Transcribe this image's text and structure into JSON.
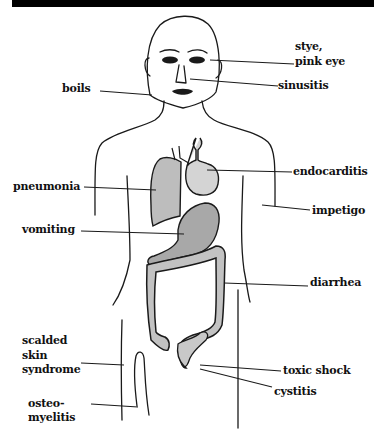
{
  "diagram": {
    "labels": {
      "stye": "stye,",
      "pink_eye": "pink eye",
      "sinusitis": "sinusitis",
      "boils": "boils",
      "pneumonia": "pneumonia",
      "endocarditis": "endocarditis",
      "impetigo": "impetigo",
      "vomiting": "vomiting",
      "diarrhea": "diarrhea",
      "scalded": "scalded",
      "skin": "skin",
      "syndrome": "syndrome",
      "toxic_shock": "toxic shock",
      "cystitis": "cystitis",
      "osteo": "osteo-",
      "myelitis": "myelitis"
    },
    "colors": {
      "ink": "#111111",
      "background": "#ffffff",
      "top_bar": "#000000"
    }
  }
}
